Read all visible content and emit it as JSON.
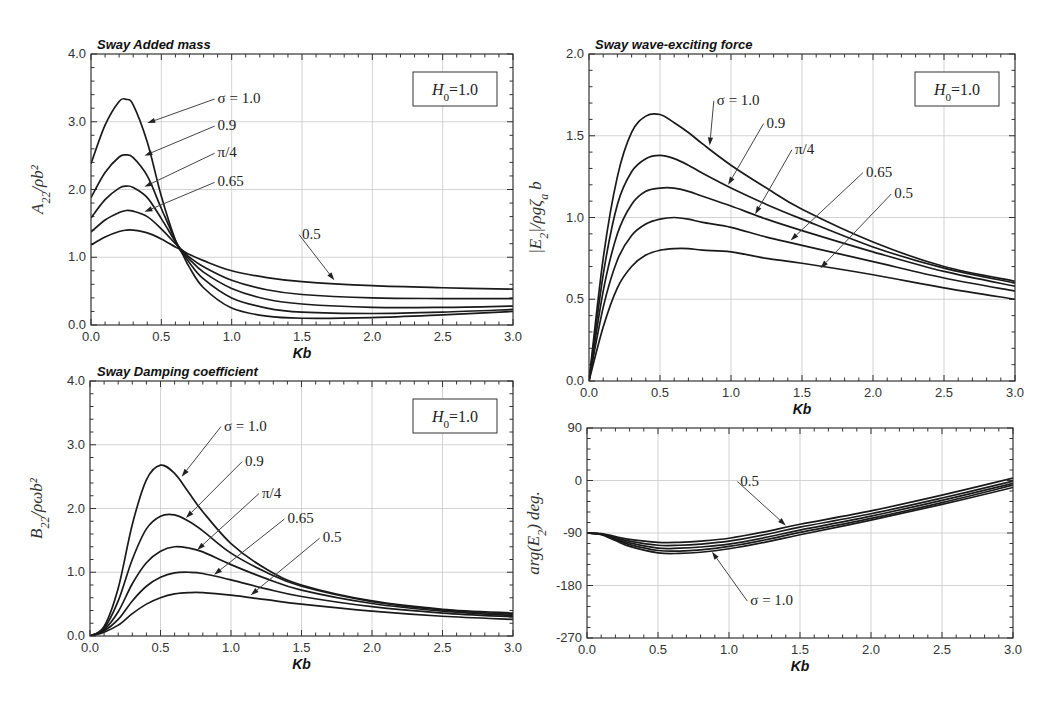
{
  "chart_data": [
    {
      "id": "added_mass",
      "type": "line",
      "title": "Sway Added mass",
      "xlabel": "Kb",
      "ylabel": "A22/ρb²",
      "xlim": [
        0,
        3.0
      ],
      "ylim": [
        0,
        4.0
      ],
      "xticks": [
        "0.0",
        "0.5",
        "1.0",
        "1.5",
        "2.0",
        "2.5",
        "3.0"
      ],
      "yticks": [
        "0.0",
        "1.0",
        "2.0",
        "3.0",
        "4.0"
      ],
      "grid": true,
      "box_label": "H0=1.0",
      "x": [
        0.0,
        0.1,
        0.2,
        0.25,
        0.3,
        0.4,
        0.5,
        0.6,
        0.65,
        0.7,
        0.8,
        1.0,
        1.25,
        1.5,
        2.0,
        2.5,
        3.0
      ],
      "series": [
        {
          "name": "σ=1.0",
          "values": [
            2.38,
            2.95,
            3.3,
            3.33,
            3.25,
            2.7,
            1.9,
            1.25,
            1.05,
            0.85,
            0.55,
            0.25,
            0.13,
            0.1,
            0.11,
            0.15,
            0.2
          ]
        },
        {
          "name": "0.9",
          "values": [
            1.88,
            2.25,
            2.48,
            2.51,
            2.47,
            2.2,
            1.72,
            1.25,
            1.07,
            0.92,
            0.68,
            0.4,
            0.25,
            0.19,
            0.17,
            0.19,
            0.23
          ]
        },
        {
          "name": "π/4",
          "values": [
            1.58,
            1.85,
            2.02,
            2.05,
            2.03,
            1.88,
            1.57,
            1.23,
            1.08,
            0.97,
            0.78,
            0.54,
            0.38,
            0.31,
            0.26,
            0.26,
            0.28
          ]
        },
        {
          "name": "0.65",
          "values": [
            1.37,
            1.55,
            1.66,
            1.69,
            1.68,
            1.6,
            1.42,
            1.2,
            1.1,
            1.0,
            0.86,
            0.66,
            0.52,
            0.45,
            0.4,
            0.39,
            0.39
          ]
        },
        {
          "name": "0.5",
          "values": [
            1.18,
            1.3,
            1.38,
            1.4,
            1.4,
            1.36,
            1.27,
            1.15,
            1.1,
            1.04,
            0.95,
            0.8,
            0.7,
            0.64,
            0.58,
            0.55,
            0.53
          ]
        }
      ],
      "annotations": [
        {
          "text": "σ=1.0",
          "tx": 0.9,
          "ty": 3.35,
          "ax": 0.4,
          "ay": 2.98
        },
        {
          "text": "0.9",
          "tx": 0.9,
          "ty": 2.95,
          "ax": 0.38,
          "ay": 2.5
        },
        {
          "text": "π/4",
          "tx": 0.9,
          "ty": 2.55,
          "ax": 0.38,
          "ay": 2.04
        },
        {
          "text": "0.65",
          "tx": 0.9,
          "ty": 2.12,
          "ax": 0.38,
          "ay": 1.67
        },
        {
          "text": "0.5",
          "tx": 1.5,
          "ty": 1.35,
          "ax": 1.73,
          "ay": 0.66
        }
      ]
    },
    {
      "id": "wave_exciting_force",
      "type": "line",
      "title": "Sway wave-exciting force",
      "xlabel": "Kb",
      "ylabel": "|E2|/ρgζa b",
      "xlim": [
        0,
        3.0
      ],
      "ylim": [
        0,
        2.0
      ],
      "xticks": [
        "0.0",
        "0.5",
        "1.0",
        "1.5",
        "2.0",
        "2.5",
        "3.0"
      ],
      "yticks": [
        "0.0",
        "0.5",
        "1.0",
        "1.5",
        "2.0"
      ],
      "grid": true,
      "box_label": "H0=1.0",
      "x": [
        0.0,
        0.1,
        0.2,
        0.3,
        0.4,
        0.5,
        0.6,
        0.7,
        0.8,
        1.0,
        1.25,
        1.5,
        2.0,
        2.5,
        3.0
      ],
      "series": [
        {
          "name": "σ=1.0",
          "values": [
            0.0,
            0.75,
            1.25,
            1.52,
            1.62,
            1.63,
            1.58,
            1.52,
            1.45,
            1.32,
            1.18,
            1.05,
            0.85,
            0.7,
            0.61
          ]
        },
        {
          "name": "0.9",
          "values": [
            0.0,
            0.65,
            1.08,
            1.28,
            1.36,
            1.38,
            1.36,
            1.32,
            1.27,
            1.18,
            1.08,
            0.99,
            0.82,
            0.69,
            0.6
          ]
        },
        {
          "name": "π/4",
          "values": [
            0.0,
            0.55,
            0.9,
            1.08,
            1.16,
            1.18,
            1.18,
            1.16,
            1.13,
            1.07,
            0.99,
            0.92,
            0.79,
            0.67,
            0.58
          ]
        },
        {
          "name": "0.65",
          "values": [
            0.0,
            0.45,
            0.74,
            0.89,
            0.96,
            0.99,
            1.0,
            0.99,
            0.97,
            0.94,
            0.88,
            0.83,
            0.73,
            0.63,
            0.55
          ]
        },
        {
          "name": "0.5",
          "values": [
            0.0,
            0.33,
            0.57,
            0.7,
            0.77,
            0.8,
            0.81,
            0.81,
            0.8,
            0.79,
            0.75,
            0.72,
            0.65,
            0.57,
            0.5
          ]
        }
      ],
      "annotations": [
        {
          "text": "σ=1.0",
          "tx": 0.9,
          "ty": 1.72,
          "ax": 0.85,
          "ay": 1.44
        },
        {
          "text": "0.9",
          "tx": 1.25,
          "ty": 1.58,
          "ax": 0.98,
          "ay": 1.2
        },
        {
          "text": "π/4",
          "tx": 1.45,
          "ty": 1.42,
          "ax": 1.17,
          "ay": 1.02
        },
        {
          "text": "0.65",
          "tx": 1.95,
          "ty": 1.28,
          "ax": 1.42,
          "ay": 0.86
        },
        {
          "text": "0.5",
          "tx": 2.15,
          "ty": 1.15,
          "ax": 1.63,
          "ay": 0.69
        }
      ]
    },
    {
      "id": "damping_coefficient",
      "type": "line",
      "title": "Sway Damping coefficient",
      "xlabel": "Kb",
      "ylabel": "B22/ρωb²",
      "xlim": [
        0,
        3.0
      ],
      "ylim": [
        0,
        4.0
      ],
      "xticks": [
        "0.0",
        "0.5",
        "1.0",
        "1.5",
        "2.0",
        "2.5",
        "3.0"
      ],
      "yticks": [
        "0.0",
        "1.0",
        "2.0",
        "3.0",
        "4.0"
      ],
      "grid": true,
      "box_label": "H0=1.0",
      "x": [
        0.0,
        0.1,
        0.2,
        0.3,
        0.4,
        0.5,
        0.6,
        0.7,
        0.8,
        1.0,
        1.25,
        1.5,
        2.0,
        2.5,
        3.0
      ],
      "series": [
        {
          "name": "σ=1.0",
          "values": [
            0.0,
            0.15,
            0.75,
            1.75,
            2.45,
            2.68,
            2.55,
            2.25,
            1.95,
            1.45,
            1.05,
            0.8,
            0.55,
            0.42,
            0.36
          ]
        },
        {
          "name": "0.9",
          "values": [
            0.0,
            0.12,
            0.55,
            1.2,
            1.68,
            1.88,
            1.9,
            1.8,
            1.65,
            1.3,
            1.0,
            0.78,
            0.54,
            0.41,
            0.34
          ]
        },
        {
          "name": "π/4",
          "values": [
            0.0,
            0.1,
            0.38,
            0.82,
            1.15,
            1.33,
            1.4,
            1.38,
            1.32,
            1.12,
            0.9,
            0.72,
            0.51,
            0.39,
            0.32
          ]
        },
        {
          "name": "0.65",
          "values": [
            0.0,
            0.08,
            0.26,
            0.55,
            0.78,
            0.92,
            0.99,
            1.0,
            0.98,
            0.88,
            0.74,
            0.62,
            0.46,
            0.36,
            0.3
          ]
        },
        {
          "name": "0.5",
          "values": [
            0.0,
            0.06,
            0.17,
            0.35,
            0.5,
            0.6,
            0.66,
            0.68,
            0.68,
            0.64,
            0.57,
            0.5,
            0.39,
            0.31,
            0.26
          ]
        }
      ],
      "annotations": [
        {
          "text": "σ=1.0",
          "tx": 0.95,
          "ty": 3.3,
          "ax": 0.65,
          "ay": 2.5
        },
        {
          "text": "0.9",
          "tx": 1.1,
          "ty": 2.75,
          "ax": 0.68,
          "ay": 1.85
        },
        {
          "text": "π/4",
          "tx": 1.22,
          "ty": 2.25,
          "ax": 0.76,
          "ay": 1.35
        },
        {
          "text": "0.65",
          "tx": 1.4,
          "ty": 1.85,
          "ax": 0.88,
          "ay": 0.96
        },
        {
          "text": "0.5",
          "tx": 1.65,
          "ty": 1.55,
          "ax": 1.14,
          "ay": 0.64
        }
      ]
    },
    {
      "id": "phase",
      "type": "line",
      "title": "",
      "xlabel": "Kb",
      "ylabel": "arg(E2) deg.",
      "xlim": [
        0,
        3.0
      ],
      "ylim": [
        -270,
        90
      ],
      "xticks": [
        "0.0",
        "0.5",
        "1.0",
        "1.5",
        "2.0",
        "2.5",
        "3.0"
      ],
      "yticks": [
        "-270",
        "-180",
        "-90",
        "0",
        "90"
      ],
      "grid": true,
      "x": [
        0.0,
        0.1,
        0.2,
        0.3,
        0.5,
        0.65,
        0.8,
        1.0,
        1.25,
        1.5,
        2.0,
        2.5,
        3.0
      ],
      "series": [
        {
          "name": "0.5",
          "values": [
            -90,
            -91,
            -96,
            -101,
            -106,
            -106,
            -104,
            -99,
            -88,
            -75,
            -52,
            -25,
            4
          ]
        },
        {
          "name": "0.65",
          "values": [
            -90,
            -92,
            -98,
            -104,
            -111,
            -111,
            -109,
            -104,
            -93,
            -80,
            -57,
            -30,
            -1
          ]
        },
        {
          "name": "π/4",
          "values": [
            -90,
            -92,
            -100,
            -107,
            -116,
            -116,
            -114,
            -109,
            -98,
            -85,
            -61,
            -34,
            -5
          ]
        },
        {
          "name": "0.9",
          "values": [
            -90,
            -92,
            -101,
            -110,
            -120,
            -121,
            -119,
            -113,
            -102,
            -89,
            -65,
            -38,
            -8
          ]
        },
        {
          "name": "σ=1.0",
          "values": [
            -90,
            -93,
            -103,
            -113,
            -124,
            -125,
            -123,
            -117,
            -106,
            -93,
            -68,
            -41,
            -12
          ]
        }
      ],
      "annotations": [
        {
          "text": "0.5",
          "tx": 1.08,
          "ty": 0,
          "ax": 1.4,
          "ay": -77
        },
        {
          "text": "σ=1.0",
          "tx": 1.15,
          "ty": -205,
          "ax": 0.88,
          "ay": -122
        }
      ]
    }
  ]
}
